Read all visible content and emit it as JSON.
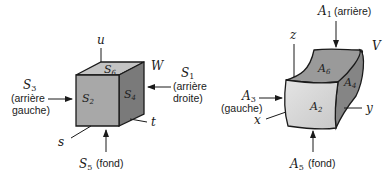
{
  "left_figure": {
    "volume_label": "W",
    "axes": {
      "vertical": "u",
      "right": "t",
      "front": "s"
    },
    "faces": {
      "top": {
        "letter": "S",
        "sub": "6"
      },
      "front": {
        "letter": "S",
        "sub": "2"
      },
      "side": {
        "letter": "S",
        "sub": "4"
      }
    },
    "annotations": {
      "left": {
        "letter": "S",
        "sub": "3",
        "line1": "(arrière",
        "line2": "gauche)"
      },
      "right": {
        "letter": "S",
        "sub": "1",
        "line1": "(arrière",
        "line2": "droite)"
      },
      "bottom": {
        "letter": "S",
        "sub": "5",
        "text": "(fond)"
      }
    }
  },
  "right_figure": {
    "volume_label": "V",
    "axes": {
      "vertical": "z",
      "right": "y",
      "front": "x"
    },
    "faces": {
      "top": {
        "letter": "A",
        "sub": "6"
      },
      "front": {
        "letter": "A",
        "sub": "2"
      },
      "side": {
        "letter": "A",
        "sub": "4"
      }
    },
    "annotations": {
      "top": {
        "letter": "A",
        "sub": "1",
        "text": "(arrière)"
      },
      "left": {
        "letter": "A",
        "sub": "3",
        "text": "(gauche)"
      },
      "bottom": {
        "letter": "A",
        "sub": "5",
        "text": "(fond)"
      }
    }
  },
  "colors": {
    "front_face_left": "#a8a8a8",
    "top_face_left": "#c4c4c4",
    "side_face_left": "#7a7a7a",
    "front_face_right": "#d6d6d6",
    "top_face_right": "#9a9a9a",
    "side_face_right": "#888888",
    "stroke": "#1a1a1a"
  }
}
